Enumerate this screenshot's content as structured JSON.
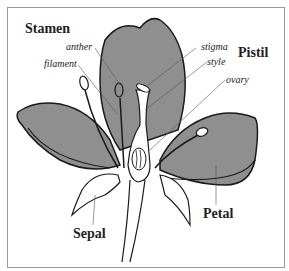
{
  "diagram": {
    "group_labels": {
      "stamen": "Stamen",
      "pistil": "Pistil"
    },
    "part_labels": {
      "anther": "anther",
      "filament": "filament",
      "stigma": "stigma",
      "style": "style",
      "ovary": "ovary",
      "petal": "Petal",
      "sepal": "Sepal"
    },
    "colors": {
      "petal_fill": "#8f8f8f",
      "outline": "#1a1a1a",
      "leader_line": "#555555",
      "border": "#9a9a9a"
    }
  }
}
